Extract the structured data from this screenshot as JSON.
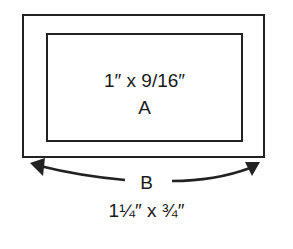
{
  "diagram": {
    "inner_rect": {
      "dimension": "1″ x 9/16″",
      "label": "A"
    },
    "outer_rect": {
      "label": "B",
      "dimension": "1¼″ x ¾″"
    },
    "colors": {
      "line": "#222222",
      "background": "#ffffff"
    }
  }
}
